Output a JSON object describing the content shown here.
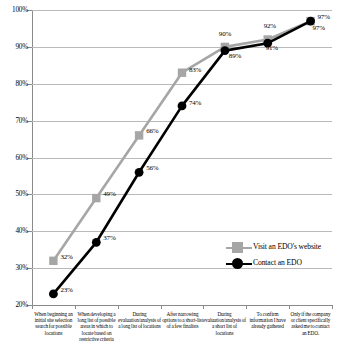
{
  "chart_data": {
    "type": "line",
    "title": "",
    "subtitle": "",
    "xlabel": "",
    "ylabel": "",
    "ylim": [
      20,
      100
    ],
    "ytick_step": 10,
    "ytick_labels": [
      "100%",
      "90%",
      "80%",
      "70%",
      "60%",
      "50%",
      "40%",
      "30%",
      "20%"
    ],
    "ytick_values": [
      100,
      90,
      80,
      70,
      60,
      50,
      40,
      30,
      20
    ],
    "grid": true,
    "grid_axis": "y",
    "legend_position": "inside-lower-right",
    "categories": [
      "When beginning an initial site selection search for possible locations",
      "When developing a long list of possible areas in which to locate based on restrictive criteria",
      "During evaluation/analysis of a long list of locations",
      "After narrowing options to a short-list of a few finalists",
      "During evaluation/analysis of a short list of locations",
      "To confirm information I have already gathered",
      "Only if the company or client specifically asked me to contact an EDO."
    ],
    "series": [
      {
        "name": "Visit an EDO's website",
        "color": "#a6a6a6",
        "marker": "square",
        "values": [
          32,
          49,
          66,
          83,
          90,
          92,
          97
        ],
        "value_labels": [
          "32%",
          "49%",
          "66%",
          "83%",
          "90%",
          "92%",
          "97%"
        ]
      },
      {
        "name": "Contact an EDO",
        "color": "#000000",
        "marker": "circle",
        "values": [
          23,
          37,
          56,
          74,
          89,
          91,
          97
        ],
        "value_labels": [
          "23%",
          "37%",
          "56%",
          "74%",
          "89%",
          "91%",
          "97%"
        ]
      }
    ]
  },
  "legend": {
    "items": [
      {
        "label": "Visit an EDO's website"
      },
      {
        "label": "Contact an EDO"
      }
    ]
  },
  "colors": {
    "series_gray": "#a6a6a6",
    "series_black": "#000000",
    "gridline": "#b9b9b9",
    "axis": "#8a8a8a",
    "background": "#ffffff"
  }
}
